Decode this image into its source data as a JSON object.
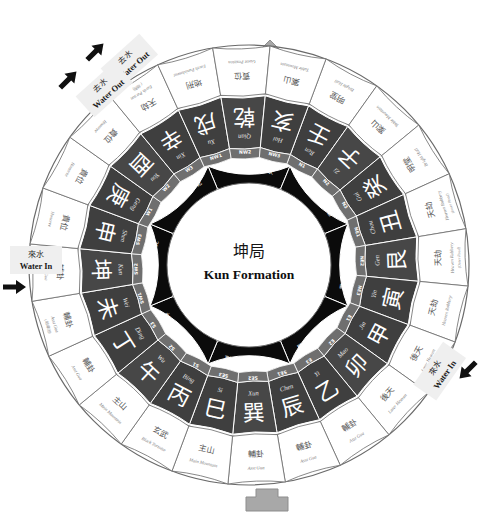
{
  "title_cn": "坤局",
  "title_en": "Kun Formation",
  "colors": {
    "dark_band": "#3f3f3f",
    "black_band": "#0b0b0b",
    "mid_band": "#6f6f6f",
    "line": "#6a6a6a",
    "text_light": "#ffffff",
    "text_dark": "#3a3a3a",
    "marker_gray": "#a8a8a8",
    "highlight": "#efefef"
  },
  "markers": {
    "facing": {
      "cn": "向",
      "en": "Facing",
      "name": "facing-marker"
    },
    "sitting": {
      "cn": "",
      "en": "",
      "name": "sitting-marker"
    }
  },
  "flow_labels": [
    {
      "cn": "去水",
      "en": "Water Out",
      "angle": 305,
      "arrow": 305
    },
    {
      "cn": "去水",
      "en": "Water Out",
      "angle": 318,
      "arrow": 318
    },
    {
      "cn": "來水",
      "en": "Water In",
      "angle": 180,
      "arrow": 180
    },
    {
      "cn": "來水",
      "en": "Water In",
      "angle": 330,
      "arrow": 330
    }
  ],
  "ring_directions": [
    {
      "en": "NORTH",
      "cn": "坎",
      "center": 118,
      "span": 45,
      "shade": "black"
    },
    {
      "en": "NORTHEAST",
      "cn": "艮",
      "center": 73,
      "span": 45,
      "shade": "black"
    },
    {
      "en": "EAST",
      "cn": "震",
      "center": 28,
      "span": 45,
      "shade": "black"
    },
    {
      "en": "SOUTHEAST",
      "cn": "巽",
      "center": 343,
      "span": 45,
      "shade": "black"
    },
    {
      "en": "SOUTH",
      "cn": "離",
      "center": 298,
      "span": 45,
      "shade": "black"
    },
    {
      "en": "SOUTHWEST",
      "cn": "坤",
      "center": 253,
      "span": 45,
      "shade": "black"
    },
    {
      "en": "WEST",
      "cn": "兌",
      "center": 208,
      "span": 45,
      "shade": "black"
    },
    {
      "en": "NORTHWEST",
      "cn": "乾",
      "center": 163,
      "span": 45,
      "shade": "black"
    }
  ],
  "sector_codes": [
    "N1",
    "N2",
    "N3",
    "NE1",
    "NE2",
    "NE3",
    "E1",
    "E2",
    "E3",
    "SE1",
    "SE2",
    "SE3",
    "S1",
    "S2",
    "S3",
    "SW1",
    "SW2",
    "SW3",
    "W1",
    "W2",
    "W3",
    "NW1",
    "NW2",
    "NW3"
  ],
  "mountains": [
    {
      "cn": "壬",
      "py": "Ren",
      "code": "N1"
    },
    {
      "cn": "子",
      "py": "Zi",
      "code": "N2"
    },
    {
      "cn": "癸",
      "py": "Gui",
      "code": "N3"
    },
    {
      "cn": "丑",
      "py": "Chou",
      "code": "NE1"
    },
    {
      "cn": "艮",
      "py": "Gen",
      "code": "NE2"
    },
    {
      "cn": "寅",
      "py": "Yin",
      "code": "NE3"
    },
    {
      "cn": "甲",
      "py": "Jia",
      "code": "E1"
    },
    {
      "cn": "卯",
      "py": "Mao",
      "code": "E2"
    },
    {
      "cn": "乙",
      "py": "Yi",
      "code": "E3"
    },
    {
      "cn": "辰",
      "py": "Chen",
      "code": "SE1"
    },
    {
      "cn": "巽",
      "py": "Xun",
      "code": "SE2"
    },
    {
      "cn": "巳",
      "py": "Si",
      "code": "SE3"
    },
    {
      "cn": "丙",
      "py": "Bing",
      "code": "S1"
    },
    {
      "cn": "午",
      "py": "Wu",
      "code": "S2"
    },
    {
      "cn": "丁",
      "py": "Ding",
      "code": "S3"
    },
    {
      "cn": "未",
      "py": "Wei",
      "code": "SW1"
    },
    {
      "cn": "坤",
      "py": "Kun",
      "code": "SW2"
    },
    {
      "cn": "申",
      "py": "Shen",
      "code": "SW3"
    },
    {
      "cn": "庚",
      "py": "Geng",
      "code": "W1"
    },
    {
      "cn": "酉",
      "py": "You",
      "code": "W2"
    },
    {
      "cn": "辛",
      "py": "Xin",
      "code": "W3"
    },
    {
      "cn": "戌",
      "py": "Xu",
      "code": "NW1"
    },
    {
      "cn": "乾",
      "py": "Qian",
      "code": "NW2"
    },
    {
      "cn": "亥",
      "py": "Hai",
      "code": "NW3"
    }
  ],
  "outer_labels": [
    {
      "cn": "明堂",
      "en": "Bright Hall",
      "sub": ""
    },
    {
      "cn": "案山",
      "en": "Table Mountain",
      "sub": ""
    },
    {
      "cn": "明堂",
      "en": "Bright Hall",
      "sub": ""
    },
    {
      "cn": "天劫",
      "en": "Heaven Robbery",
      "sub": "(Inner Road)"
    },
    {
      "cn": "天劫",
      "en": "Heaven Robbery",
      "sub": "(Outer Road)"
    },
    {
      "cn": "天劫",
      "en": "Heaven Robbery",
      "sub": ""
    },
    {
      "cn": "後天",
      "en": "Later Heaven",
      "sub": "(大庫池)"
    },
    {
      "cn": "後天",
      "en": "Later Heaven",
      "sub": ""
    },
    {
      "cn": "輔卦",
      "en": "Asst Gua",
      "sub": ""
    },
    {
      "cn": "輔卦",
      "en": "Asst Gua",
      "sub": ""
    },
    {
      "cn": "輔卦",
      "en": "Asst Gua",
      "sub": ""
    },
    {
      "cn": "主山",
      "en": "Main Mountain",
      "sub": ""
    },
    {
      "cn": "玄武",
      "en": "Black Tortoise",
      "sub": ""
    },
    {
      "cn": "主山",
      "en": "Main Mountain",
      "sub": ""
    },
    {
      "cn": "輔卦",
      "en": "Asst Gua",
      "sub": ""
    },
    {
      "cn": "輔卦",
      "en": "Asst Gua",
      "sub": "(地庫池)"
    },
    {
      "cn": "輔卦",
      "en": "Asst Gua",
      "sub": ""
    },
    {
      "cn": "貴位",
      "en": "Honoree",
      "sub": ""
    },
    {
      "cn": "貴位",
      "en": "Honoree",
      "sub": ""
    },
    {
      "cn": "貴位",
      "en": "Honoree",
      "sub": ""
    },
    {
      "cn": "天劫",
      "en": "Earth Person",
      "sub": "(地刑)"
    },
    {
      "cn": "地刑",
      "en": "Earth Punishment",
      "sub": ""
    },
    {
      "cn": "賓位",
      "en": "Guest Position",
      "sub": ""
    },
    {
      "cn": "案山",
      "en": "Table Mountain",
      "sub": ""
    }
  ],
  "geometry": {
    "cx": 249,
    "cy": 265,
    "r_outer": 220,
    "r_outer_in": 172,
    "r_mtn_out": 170,
    "r_mtn_in": 118,
    "r_code_out": 118,
    "r_code_in": 108,
    "r_dir_out": 107,
    "r_dir_in": 83,
    "r_core": 82,
    "rotation": -28
  }
}
